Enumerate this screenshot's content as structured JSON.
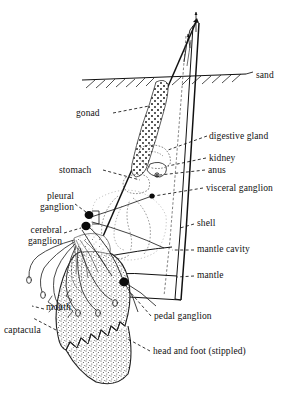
{
  "figure": {
    "background_color": "#ffffff",
    "ink_color": "#111111",
    "stipple_color": "#4a4a4a"
  },
  "labels": [
    {
      "key": "sand",
      "text": "sand",
      "x": 256,
      "y": 76,
      "align": "left"
    },
    {
      "key": "gonad",
      "text": "gonad",
      "x": 84,
      "y": 116,
      "align": "left"
    },
    {
      "key": "digestive_gland",
      "text": "digestive gland",
      "x": 209,
      "y": 139,
      "align": "left"
    },
    {
      "key": "kidney",
      "text": "kidney",
      "x": 208,
      "y": 160,
      "align": "left"
    },
    {
      "key": "anus",
      "text": "anus",
      "x": 207,
      "y": 171,
      "align": "left"
    },
    {
      "key": "visceral_ganglion",
      "text": "visceral ganglion",
      "x": 205,
      "y": 190,
      "align": "left"
    },
    {
      "key": "stomach",
      "text": "stomach",
      "x": 60,
      "y": 172,
      "align": "left"
    },
    {
      "key": "pleural_ganglion",
      "text": "pleural\nganglion",
      "x": 25,
      "y": 196,
      "align": "right"
    },
    {
      "key": "cerebral_ganglion",
      "text": "cerebral\nganglion",
      "x": 14,
      "y": 230,
      "align": "right"
    },
    {
      "key": "shell",
      "text": "shell",
      "x": 196,
      "y": 225,
      "align": "left"
    },
    {
      "key": "mantle_cavity",
      "text": "mantle cavity",
      "x": 196,
      "y": 251,
      "align": "left"
    },
    {
      "key": "mantle",
      "text": "mantle",
      "x": 196,
      "y": 277,
      "align": "left"
    },
    {
      "key": "mouth",
      "text": "mouth",
      "x": 47,
      "y": 309,
      "align": "left"
    },
    {
      "key": "captacula",
      "text": "captacula",
      "x": 6,
      "y": 332,
      "align": "left"
    },
    {
      "key": "pedal_ganglion",
      "text": "pedal ganglion",
      "x": 153,
      "y": 319,
      "align": "left"
    },
    {
      "key": "head_and_foot",
      "text": "head and foot (stippled)",
      "x": 152,
      "y": 354,
      "align": "left"
    }
  ],
  "structures": {
    "shell": "tusk-shaped tapering tube, apex upper right, aperture lower left",
    "sand_line": "horizontal substrate surface with diagonal hatching below",
    "apex_arrows": "water flow arrows at shell apex",
    "ganglia": [
      "pleural ganglion",
      "cerebral ganglion",
      "visceral ganglion",
      "pedal ganglion"
    ],
    "foot_texture": "stippled with zigzag/serrated margin",
    "gonad_texture": "dotted stipple elongated organ"
  }
}
